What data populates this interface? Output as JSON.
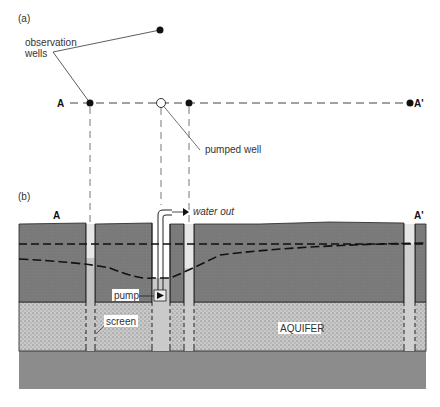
{
  "panel_a": {
    "label": "(a)",
    "observation_wells_label_line1": "observation",
    "observation_wells_label_line2": "wells",
    "pumped_well_label": "pumped well",
    "section_start": "A",
    "section_end": "A'"
  },
  "panel_b": {
    "label": "(b)",
    "section_start": "A",
    "section_end": "A'",
    "water_out_label": "water out",
    "pump_label": "pump",
    "screen_label": "screen",
    "aquifer_label": "AQUIFER"
  },
  "colors": {
    "confining_layer": "#7a7a7a",
    "aquifer_fill": "#bdbdbd",
    "bedrock": "#8a8a8a",
    "well_casing": "#e4e4e4",
    "line": "#222222"
  }
}
